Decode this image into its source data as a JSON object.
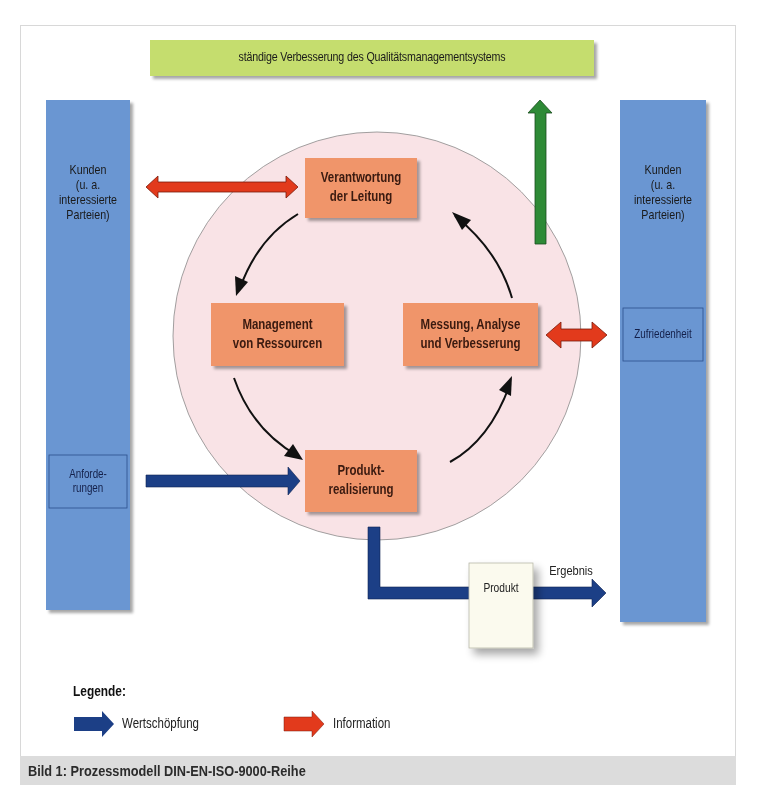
{
  "banner": {
    "label": "ständige Verbesserung des Qualitätsmanagementsystems",
    "color": "#c5dd6e"
  },
  "left_column": {
    "label_lines": [
      "Kunden",
      "(u. a.",
      "interessierte",
      "Parteien)"
    ],
    "sub_box": {
      "lines": [
        "Anforde-",
        "rungen"
      ]
    },
    "color": "#6a96d2"
  },
  "right_column": {
    "label_lines": [
      "Kunden",
      "(u. a.",
      "interessierte",
      "Parteien)"
    ],
    "sub_box": {
      "lines": [
        "Zufriedenheit"
      ]
    },
    "color": "#6a96d2"
  },
  "cycle": {
    "circle_color": "#f9e3e6",
    "box_color": "#f0956a",
    "boxes": [
      {
        "id": "verantwortung",
        "lines": [
          "Verantwortung",
          "der Leitung"
        ]
      },
      {
        "id": "management",
        "lines": [
          "Management",
          "von Ressourcen"
        ]
      },
      {
        "id": "messung",
        "lines": [
          "Messung, Analyse",
          "und Verbesserung"
        ]
      },
      {
        "id": "produkt",
        "lines": [
          "Produkt-",
          "realisierung"
        ]
      }
    ]
  },
  "product_box": {
    "label": "Produkt",
    "color": "#fbfaee"
  },
  "result_label": "Ergebnis",
  "legend": {
    "title": "Legende:",
    "items": [
      {
        "label": "Wertschöpfung",
        "color": "#1c3f86"
      },
      {
        "label": "Information",
        "color": "#e23a1c"
      }
    ]
  },
  "arrow_colors": {
    "value": "#1c3f86",
    "information": "#e23a1c",
    "improvement": "#2e8a36",
    "cycle": "#111111"
  },
  "caption": "Bild 1:  Prozessmodell DIN-EN-ISO-9000-Reihe"
}
